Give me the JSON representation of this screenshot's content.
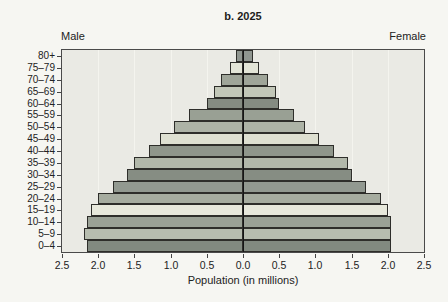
{
  "chart_data": {
    "type": "bar",
    "subtype": "population-pyramid",
    "title": "b. 2025",
    "xlabel": "Population (in millions)",
    "left_side_label": "Male",
    "right_side_label": "Female",
    "categories_order": "bottom-to-top",
    "categories": [
      "0–4",
      "5–9",
      "10–14",
      "15–19",
      "20–24",
      "25–29",
      "30–34",
      "35–39",
      "40–44",
      "45–49",
      "50–54",
      "55–59",
      "60–64",
      "65–69",
      "70–74",
      "75–79",
      "80+"
    ],
    "series": [
      {
        "name": "Male",
        "side": "left",
        "values": [
          2.15,
          2.2,
          2.15,
          2.1,
          2.0,
          1.8,
          1.6,
          1.5,
          1.3,
          1.15,
          0.95,
          0.75,
          0.5,
          0.4,
          0.3,
          0.18,
          0.1
        ]
      },
      {
        "name": "Female",
        "side": "right",
        "values": [
          2.05,
          2.05,
          2.05,
          2.0,
          1.9,
          1.7,
          1.5,
          1.45,
          1.25,
          1.05,
          0.85,
          0.7,
          0.5,
          0.45,
          0.35,
          0.22,
          0.14
        ]
      }
    ],
    "x_tick_labels": [
      "2.5",
      "2.0",
      "1.5",
      "1.0",
      "0.5",
      "0.0",
      "0.5",
      "1.0",
      "1.5",
      "2.0",
      "2.5"
    ],
    "xlim_each_side": [
      0,
      2.5
    ],
    "x_tick_step": 0.5,
    "grid": "faint-vertical",
    "legend": "none",
    "bar_colors_bottom_to_top": [
      "#828a80",
      "#b7bdaf",
      "#9aa195",
      "#e7e8db",
      "#a6ac9f",
      "#929990",
      "#868d83",
      "#b2b8aa",
      "#8f968b",
      "#dee0d1",
      "#adb3a6",
      "#99a094",
      "#858c82",
      "#c2c7b8",
      "#9fa599",
      "#e3e5d7",
      "#909690"
    ],
    "colors": {
      "page_bg": "#f6f6f2",
      "plot_bg": "#eaeae4",
      "gridline": "#f4f4ee",
      "plot_border": "#4a4a4a",
      "bar_border": "#2e2e2a",
      "center_axis": "#151515",
      "text": "#222222"
    }
  }
}
